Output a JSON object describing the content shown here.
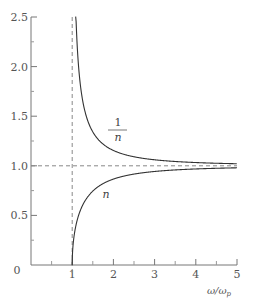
{
  "chart_data": {
    "type": "line",
    "title": "",
    "xlabel": "ω/ωp",
    "xlabel_main": "ω/ω",
    "xlabel_sub": "p",
    "ylabel": "",
    "xlim": [
      0,
      5
    ],
    "ylim": [
      0,
      2.5
    ],
    "x_ticks": [
      0,
      1,
      2,
      3,
      4,
      5
    ],
    "x_tick_labels": [
      "0",
      "1",
      "2",
      "3",
      "4",
      "5"
    ],
    "x_minor_ticks": [
      0.5,
      1.5,
      2.5,
      3.5,
      4.5
    ],
    "y_ticks": [
      0.5,
      1.0,
      1.5,
      2.0,
      2.5
    ],
    "y_tick_labels": [
      "0.5",
      "1.0",
      "1.5",
      "2.0",
      "2.5"
    ],
    "y_minor_ticks": [
      0.25,
      0.75,
      1.25,
      1.75,
      2.25
    ],
    "grid": false,
    "reference_lines": [
      {
        "orientation": "vertical",
        "value": 1,
        "style": "dashed"
      },
      {
        "orientation": "horizontal",
        "value": 1.0,
        "style": "dashed"
      }
    ],
    "series": [
      {
        "name": "1/n",
        "label_num": "1",
        "label_den": "n",
        "x": [
          1.08,
          1.1,
          1.2,
          1.3,
          1.5,
          1.75,
          2.0,
          2.5,
          3.0,
          3.5,
          4.0,
          4.5,
          5.0
        ],
        "values": [
          2.66,
          2.18,
          1.81,
          1.56,
          1.34,
          1.22,
          1.15,
          1.09,
          1.06,
          1.04,
          1.03,
          1.03,
          1.02
        ]
      },
      {
        "name": "n",
        "label": "n",
        "x": [
          1.0,
          1.05,
          1.1,
          1.2,
          1.3,
          1.5,
          1.75,
          2.0,
          2.5,
          3.0,
          3.5,
          4.0,
          4.5,
          5.0
        ],
        "values": [
          0.0,
          0.3,
          0.42,
          0.55,
          0.64,
          0.75,
          0.82,
          0.87,
          0.92,
          0.94,
          0.96,
          0.97,
          0.98,
          0.98
        ]
      }
    ],
    "legend": "none",
    "annotations": [
      "1/n",
      "n"
    ]
  }
}
